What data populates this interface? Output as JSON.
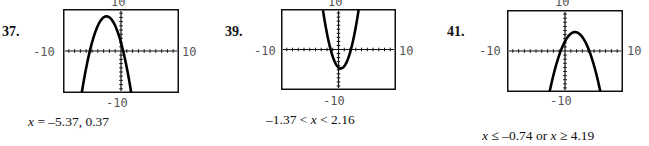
{
  "problems": [
    {
      "number": "37.",
      "window": {
        "xmin": "-10",
        "xmax": "10",
        "ymin": "-10",
        "ymax": "10"
      },
      "answer": "x = –5.37, 0.37"
    },
    {
      "number": "39.",
      "window": {
        "xmin": "-10",
        "xmax": "10",
        "ymin": "-10",
        "ymax": "10"
      },
      "answer": "–1.37 < x < 2.16"
    },
    {
      "number": "41.",
      "window": {
        "xmin": "-10",
        "xmax": "10",
        "ymin": "-10",
        "ymax": "10"
      },
      "answer": "x ≤ –0.74 or x ≥ 4.19"
    }
  ],
  "chart_data": [
    {
      "type": "line",
      "title": "37.",
      "xlim": [
        -10,
        10
      ],
      "ylim": [
        -10,
        10
      ],
      "series": [
        {
          "name": "y = -x^2 - 5x + 2",
          "x": [
            -6.5,
            -5.37,
            -4,
            -2.5,
            -1,
            0.37,
            1.5
          ],
          "y": [
            -6.75,
            0,
            6,
            8.25,
            6,
            0,
            -7.75
          ]
        }
      ],
      "annotations": [
        "x = -5.37, 0.37"
      ]
    },
    {
      "type": "line",
      "title": "39.",
      "xlim": [
        -10,
        10
      ],
      "ylim": [
        -10,
        10
      ],
      "series": [
        {
          "name": "parabola (opens up)",
          "x": [
            -2.9,
            -1.37,
            0.4,
            2.16,
            3.0
          ],
          "y": [
            10,
            0,
            -4.6,
            0,
            10
          ]
        }
      ],
      "annotations": [
        "-1.37 < x < 2.16"
      ]
    },
    {
      "type": "line",
      "title": "41.",
      "xlim": [
        -10,
        10
      ],
      "ylim": [
        -10,
        10
      ],
      "series": [
        {
          "name": "parabola (opens down)",
          "x": [
            -2.4,
            -0.74,
            1.7,
            4.19,
            5.6
          ],
          "y": [
            -10,
            0,
            4.6,
            0,
            -10
          ]
        }
      ],
      "annotations": [
        "x ≤ -0.74 or x ≥ 4.19"
      ]
    }
  ]
}
